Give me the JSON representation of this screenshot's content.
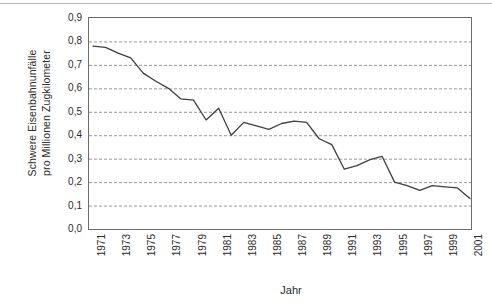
{
  "chart_data": {
    "type": "line",
    "title": "",
    "xlabel": "Jahr",
    "ylabel_line1": "Schwere Eisenbahnunfälle",
    "ylabel_line2": "pro Millionen Zugkilometer",
    "ylim": [
      0.0,
      0.9
    ],
    "xlim": [
      1971,
      2001
    ],
    "grid": "horizontal-dashed",
    "legend": "none",
    "line_color": "#3f3f3f",
    "grid_color": "#8c8c8c",
    "axis_color": "#6b6b6b",
    "ytick_labels": [
      "0,9",
      "0,8",
      "0,7",
      "0,6",
      "0,5",
      "0,4",
      "0,3",
      "0,2",
      "0,1",
      "0,0"
    ],
    "ytick_values": [
      0.9,
      0.8,
      0.7,
      0.6,
      0.5,
      0.4,
      0.3,
      0.2,
      0.1,
      0.0
    ],
    "xtick_labels": [
      "1971",
      "1973",
      "1975",
      "1977",
      "1979",
      "1981",
      "1983",
      "1985",
      "1987",
      "1989",
      "1991",
      "1993",
      "1995",
      "1997",
      "1999",
      "2001"
    ],
    "xtick_values": [
      1971,
      1973,
      1975,
      1977,
      1979,
      1981,
      1983,
      1985,
      1987,
      1989,
      1991,
      1993,
      1995,
      1997,
      1999,
      2001
    ],
    "x": [
      1971,
      1972,
      1973,
      1974,
      1975,
      1976,
      1977,
      1978,
      1979,
      1980,
      1981,
      1982,
      1983,
      1984,
      1985,
      1986,
      1987,
      1988,
      1989,
      1990,
      1991,
      1992,
      1993,
      1994,
      1995,
      1996,
      1997,
      1998,
      1999,
      2000,
      2001
    ],
    "values": [
      0.78,
      0.775,
      0.75,
      0.73,
      0.665,
      0.63,
      0.6,
      0.555,
      0.55,
      0.465,
      0.515,
      0.4,
      0.455,
      0.44,
      0.425,
      0.45,
      0.46,
      0.455,
      0.385,
      0.36,
      0.255,
      0.27,
      0.295,
      0.31,
      0.2,
      0.185,
      0.165,
      0.185,
      0.18,
      0.175,
      0.13
    ],
    "series": [
      {
        "name": "Schwere Eisenbahnunfälle pro Millionen Zugkilometer",
        "values": [
          0.78,
          0.775,
          0.75,
          0.73,
          0.665,
          0.63,
          0.6,
          0.555,
          0.55,
          0.465,
          0.515,
          0.4,
          0.455,
          0.44,
          0.425,
          0.45,
          0.46,
          0.455,
          0.385,
          0.36,
          0.255,
          0.27,
          0.295,
          0.31,
          0.2,
          0.185,
          0.165,
          0.185,
          0.18,
          0.175,
          0.13
        ]
      }
    ]
  }
}
